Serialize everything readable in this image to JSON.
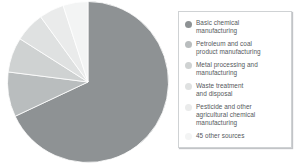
{
  "chart_data": {
    "type": "pie",
    "title": "",
    "subtitle": "",
    "xlabel": "",
    "ylabel": "",
    "grid": false,
    "legend_position": "right",
    "start_angle_deg": 0,
    "direction": "clockwise",
    "categories": [
      "Basic chemical manufacturing",
      "Petroleum and coal product manufacturing",
      "Metal processing and manufacturing",
      "Waste treatment and disposal",
      "Pesticide and other agricultural chemical manufacturing",
      "45 other sources"
    ],
    "values": [
      68,
      9,
      7,
      6,
      5,
      5
    ],
    "colors": [
      "#8e9294",
      "#b9bdbe",
      "#cfd2d2",
      "#dfe1e1",
      "#eaebeb",
      "#f3f4f4"
    ],
    "annotations": []
  },
  "chart": {
    "name": "sources-pie-chart",
    "slices": [
      {
        "label": "Basic chemical manufacturing",
        "value": 68,
        "color": "#8e9294"
      },
      {
        "label": "Petroleum and coal product manufacturing",
        "value": 9,
        "color": "#b9bdbe"
      },
      {
        "label": "Metal processing and manufacturing",
        "value": 7,
        "color": "#cfd2d2"
      },
      {
        "label": "Waste treatment and disposal",
        "value": 6,
        "color": "#dfe1e1"
      },
      {
        "label": "Pesticide and other agricultural chemical manufacturing",
        "value": 5,
        "color": "#eaebeb"
      },
      {
        "label": "45 other sources",
        "value": 5,
        "color": "#f3f4f4"
      }
    ]
  },
  "legend": {
    "items": [
      {
        "label": "Basic chemical\nmanufacturing",
        "color": "#8e9294",
        "swatch_name": "legend-swatch-basic-chemical"
      },
      {
        "label": "Petroleum and coal\nproduct manufacturing",
        "color": "#b9bdbe",
        "swatch_name": "legend-swatch-petroleum-coal"
      },
      {
        "label": "Metal processing and\nmanufacturing",
        "color": "#cfd2d2",
        "swatch_name": "legend-swatch-metal-processing"
      },
      {
        "label": "Waste treatment\nand disposal",
        "color": "#dfe1e1",
        "swatch_name": "legend-swatch-waste-treatment"
      },
      {
        "label": "Pesticide and other\nagricultural chemical\nmanufacturing",
        "color": "#eaebeb",
        "swatch_name": "legend-swatch-pesticide"
      },
      {
        "label": "45 other sources",
        "color": "#f3f4f4",
        "swatch_name": "legend-swatch-other-sources"
      }
    ]
  }
}
